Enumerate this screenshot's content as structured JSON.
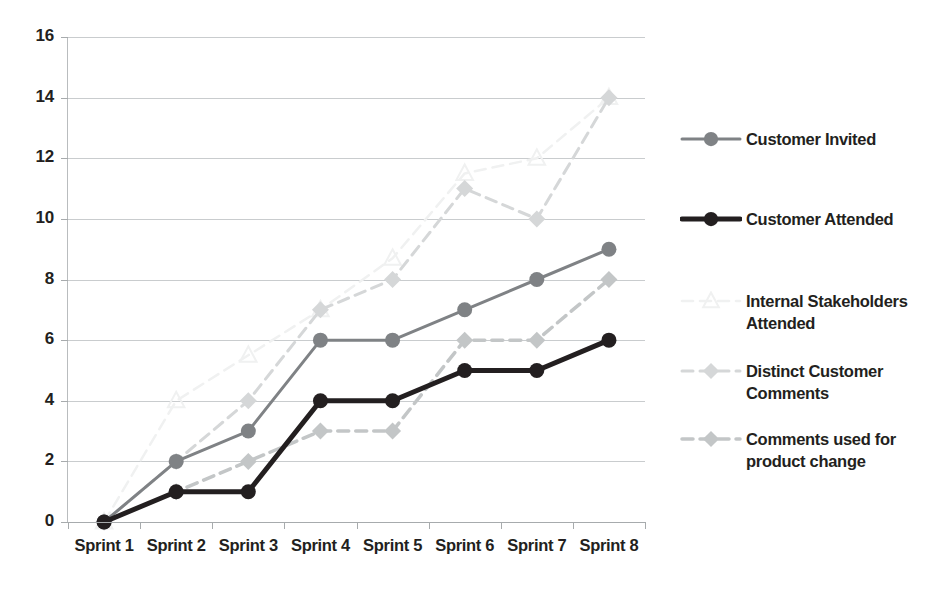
{
  "chart_data": {
    "type": "line",
    "title": "",
    "xlabel": "",
    "ylabel": "",
    "categories": [
      "Sprint 1",
      "Sprint 2",
      "Sprint 3",
      "Sprint 4",
      "Sprint 5",
      "Sprint 6",
      "Sprint 7",
      "Sprint 8"
    ],
    "ylim": [
      0,
      16
    ],
    "ytick_step": 2,
    "yticks": [
      "16",
      "14",
      "12",
      "10",
      "8",
      "6",
      "4",
      "2",
      "0"
    ],
    "grid": true,
    "legend_position": "right",
    "series": [
      {
        "name": "Customer Invited",
        "values": [
          0,
          2,
          3,
          6,
          6,
          7,
          8,
          9
        ],
        "color": "#7f8285",
        "style": "solid",
        "marker": "circle",
        "width": 3
      },
      {
        "name": "Customer Attended",
        "values": [
          0,
          1,
          1,
          4,
          4,
          5,
          5,
          6
        ],
        "color": "#231f20",
        "style": "solid",
        "marker": "circle",
        "width": 5
      },
      {
        "name": "Internal Stakeholders Attended",
        "values": [
          0,
          4,
          5.5,
          7,
          8.7,
          11.5,
          12,
          14
        ],
        "color": "#f0f1f1",
        "style": "dashed",
        "marker": "triangle",
        "width": 2.5
      },
      {
        "name": "Distinct Customer Comments",
        "values": [
          0,
          2,
          4,
          7,
          8,
          11,
          10,
          14
        ],
        "color": "#d5d7d8",
        "style": "dashed",
        "marker": "diamond",
        "width": 3
      },
      {
        "name": "Comments used for product change",
        "values": [
          0,
          1,
          2,
          3,
          3,
          6,
          6,
          8
        ],
        "color": "#c3c6c7",
        "style": "dashed",
        "marker": "diamond",
        "width": 3.5
      }
    ]
  },
  "legend": {
    "entries": [
      {
        "label": "Customer Invited"
      },
      {
        "label": "Customer Attended"
      },
      {
        "label": "Internal Stakeholders\nAttended"
      },
      {
        "label": "Distinct Customer\nComments"
      },
      {
        "label": "Comments used for\nproduct change"
      }
    ]
  },
  "colors": {
    "gridline": "#c9ccce",
    "axis": "#a7abad",
    "text": "#231f20",
    "background": "#ffffff"
  }
}
